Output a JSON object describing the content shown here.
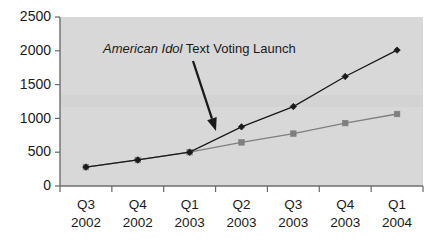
{
  "chart_data": {
    "type": "line",
    "title": "",
    "xlabel": "",
    "ylabel": "",
    "ylim": [
      0,
      2500
    ],
    "ytick_step": 500,
    "ytick_labels": [
      "0",
      "500",
      "1000",
      "1500",
      "2000",
      "2500"
    ],
    "ytick_values": [
      0,
      500,
      1000,
      1500,
      2000,
      2500
    ],
    "grid": false,
    "legend": "none",
    "categories": [
      "Q3 2002",
      "Q4 2002",
      "Q1 2003",
      "Q2 2003",
      "Q3 2003",
      "Q4 2003",
      "Q1 2004"
    ],
    "xtick_lines": [
      {
        "quarter": "Q3",
        "year": "2002"
      },
      {
        "quarter": "Q4",
        "year": "2002"
      },
      {
        "quarter": "Q1",
        "year": "2003"
      },
      {
        "quarter": "Q2",
        "year": "2003"
      },
      {
        "quarter": "Q3",
        "year": "2003"
      },
      {
        "quarter": "Q4",
        "year": "2003"
      },
      {
        "quarter": "Q1",
        "year": "2004"
      }
    ],
    "series": [
      {
        "name": "series-diamond",
        "marker": "diamond",
        "color": "#1a1a1a",
        "values": [
          280,
          385,
          500,
          875,
          1175,
          1620,
          2010
        ]
      },
      {
        "name": "series-square",
        "marker": "square",
        "color": "#7f7f7f",
        "values": [
          280,
          385,
          500,
          645,
          775,
          930,
          1065
        ]
      }
    ],
    "annotations": [
      {
        "id": "american-idol-launch",
        "italic_text": "American Idol",
        "plain_text": " Text Voting Launch",
        "full_text": "American Idol Text Voting Launch",
        "arrow": {
          "from_x": 193,
          "from_y": 61,
          "to_x": 216,
          "to_y": 131
        }
      }
    ],
    "colors": {
      "plot_background": "#d8d8d8",
      "page_background": "#ffffff",
      "axis": "#666666",
      "text": "#1a1a1a",
      "series_1": "#1a1a1a",
      "series_2": "#7f7f7f"
    }
  }
}
